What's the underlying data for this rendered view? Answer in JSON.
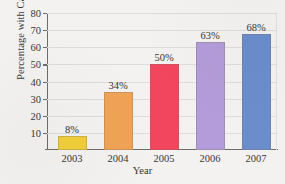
{
  "chart_data": {
    "type": "bar",
    "title": "",
    "categories": [
      "2003",
      "2004",
      "2005",
      "2006",
      "2007"
    ],
    "values": [
      8,
      34,
      50,
      63,
      68
    ],
    "data_labels": [
      "8%",
      "34%",
      "50%",
      "63%",
      "68%"
    ],
    "xlabel": "Year",
    "ylabel": "Percentage with Cameras",
    "ylim": [
      0,
      80
    ],
    "yticks": [
      10,
      20,
      30,
      40,
      50,
      60,
      70,
      80
    ],
    "ytick_labels": [
      "10",
      "20",
      "30",
      "40",
      "50",
      "60",
      "70",
      "80"
    ],
    "grid": "horizontal",
    "legend": "none",
    "bar_colors": [
      "#F2CE3A",
      "#F0A355",
      "#F2455E",
      "#B39CD9",
      "#6B8DCC"
    ],
    "axis_color": "#6E6C69",
    "grid_color": "#DEDCD9",
    "background": "#F3F2F0"
  }
}
